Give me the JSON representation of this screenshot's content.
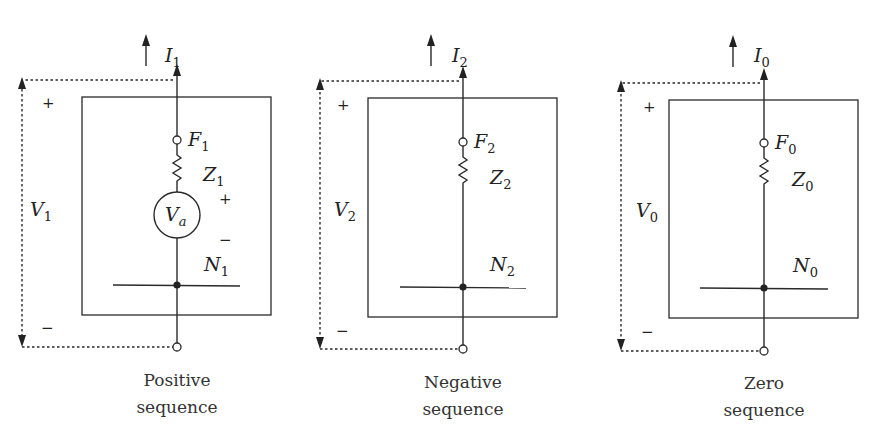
{
  "figure": {
    "panels": [
      {
        "id": "positive",
        "current": {
          "sym": "I",
          "sub": "1"
        },
        "fault_node": {
          "sym": "F",
          "sub": "1"
        },
        "impedance": {
          "sym": "Z",
          "sub": "1"
        },
        "neutral": {
          "sym": "N",
          "sub": "1"
        },
        "voltage": {
          "sym": "V",
          "sub": "1"
        },
        "source": {
          "sym": "V",
          "sub": "a",
          "plus": "+",
          "minus": "−"
        },
        "plus": "+",
        "minus": "−",
        "caption": [
          "Positive",
          "sequence"
        ]
      },
      {
        "id": "negative",
        "current": {
          "sym": "I",
          "sub": "2"
        },
        "fault_node": {
          "sym": "F",
          "sub": "2"
        },
        "impedance": {
          "sym": "Z",
          "sub": "2"
        },
        "neutral": {
          "sym": "N",
          "sub": "2"
        },
        "voltage": {
          "sym": "V",
          "sub": "2"
        },
        "plus": "+",
        "minus": "−",
        "caption": [
          "Negative",
          "sequence"
        ]
      },
      {
        "id": "zero",
        "current": {
          "sym": "I",
          "sub": "0"
        },
        "fault_node": {
          "sym": "F",
          "sub": "0"
        },
        "impedance": {
          "sym": "Z",
          "sub": "0"
        },
        "neutral": {
          "sym": "N",
          "sub": "0"
        },
        "voltage": {
          "sym": "V",
          "sub": "0"
        },
        "plus": "+",
        "minus": "−",
        "caption": [
          "Zero",
          "sequence"
        ]
      }
    ],
    "colors": {
      "ink": "#2a2a2a",
      "background": "#ffffff"
    }
  }
}
